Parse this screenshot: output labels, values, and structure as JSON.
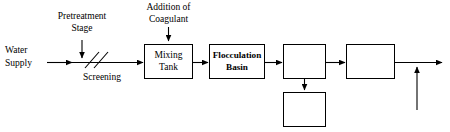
{
  "diagram": {
    "background_color": "#ffffff",
    "stroke_color": "#000000",
    "inputs": {
      "water_supply_line1": "Water",
      "water_supply_line2": "Supply"
    },
    "annotations": {
      "pretreatment_line1": "Pretreatment",
      "pretreatment_line2": "Stage",
      "screening": "Screening",
      "coagulant_line1": "Addition of",
      "coagulant_line2": "Coagulant"
    },
    "boxes": [
      {
        "id": "mixing-tank",
        "line1": "Mixing",
        "line2": "Tank",
        "bold": false
      },
      {
        "id": "flocculation-basin",
        "line1": "Flocculation",
        "line2": "Basin",
        "bold": true
      },
      {
        "id": "unit-box-3",
        "line1": "",
        "line2": "",
        "bold": false
      },
      {
        "id": "unit-box-4",
        "line1": "",
        "line2": "",
        "bold": false
      },
      {
        "id": "unit-box-5",
        "line1": "",
        "line2": "",
        "bold": false
      }
    ]
  }
}
